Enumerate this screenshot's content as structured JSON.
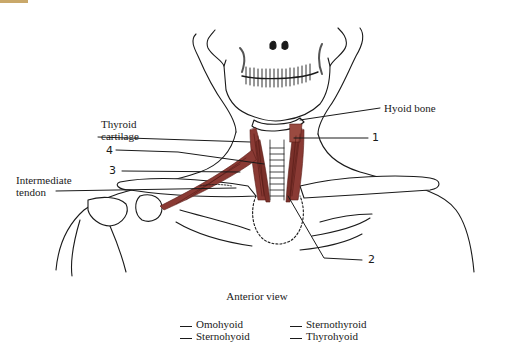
{
  "figure": {
    "view_caption": "Anterior view",
    "muscle_color": "#8a3a34",
    "line_color": "#1a1a1a"
  },
  "labels": {
    "hyoid_bone": "Hyoid bone",
    "thyroid_cartilage_line1": "Thyroid",
    "thyroid_cartilage_line2": "cartilage",
    "intermediate_tendon_line1": "Intermediate",
    "intermediate_tendon_line2": "tendon",
    "num_1": "1",
    "num_2": "2",
    "num_3": "3",
    "num_4": "4"
  },
  "legend": {
    "items": [
      {
        "label": "Omohyoid"
      },
      {
        "label": "Sternohyoid"
      },
      {
        "label": "Sternothyroid"
      },
      {
        "label": "Thyrohyoid"
      }
    ]
  }
}
